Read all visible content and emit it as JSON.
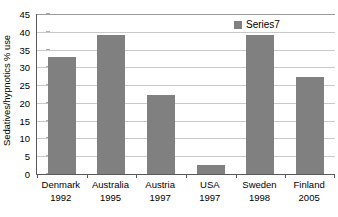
{
  "chart_data": {
    "type": "bar",
    "title": "",
    "xlabel": "",
    "ylabel": "Sedatives/hypnotics % use",
    "ylim": [
      0,
      45
    ],
    "ytick_step": 5,
    "yticks": [
      0,
      5,
      10,
      15,
      20,
      25,
      30,
      35,
      40,
      45
    ],
    "grid": true,
    "legend_position": "top-right",
    "categories": [
      "Denmark 1992",
      "Australia 1995",
      "Austria 1997",
      "USA 1997",
      "Sweden 1998",
      "Finland 2005"
    ],
    "category_parts": [
      {
        "name": "Denmark",
        "year": "1992"
      },
      {
        "name": "Australia",
        "year": "1995"
      },
      {
        "name": "Austria",
        "year": "1997"
      },
      {
        "name": "USA",
        "year": "1997"
      },
      {
        "name": "Sweden",
        "year": "1998"
      },
      {
        "name": "Finland",
        "year": "2005"
      }
    ],
    "series": [
      {
        "name": "Series7",
        "color": "#808080",
        "values": [
          33.0,
          39.2,
          22.1,
          2.5,
          39.2,
          27.3
        ]
      }
    ]
  },
  "legend": {
    "entries": [
      {
        "label": "Series7",
        "color": "#808080"
      }
    ]
  },
  "colors": {
    "bar": "#808080",
    "axis": "#595959",
    "gridline": "#c9c9c9",
    "background": "#ffffff",
    "text": "#000000"
  }
}
